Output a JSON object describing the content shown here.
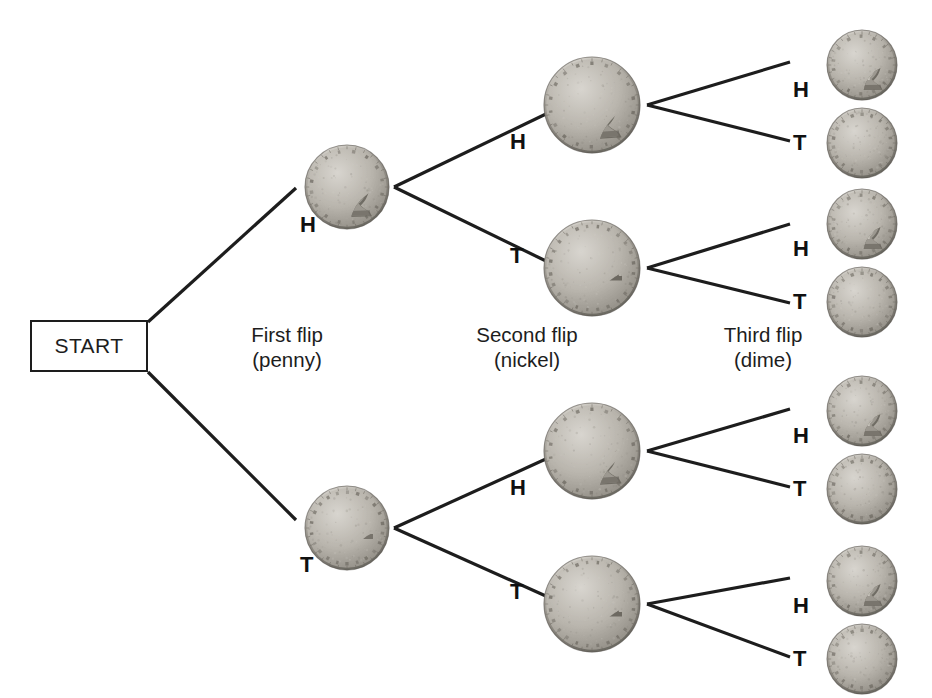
{
  "diagram": {
    "background_color": "#ffffff",
    "line_color": "#1d1d1d",
    "text_color": "#1d1d1d"
  },
  "start": {
    "label": "START",
    "x": 30,
    "y": 320,
    "w": 118,
    "h": 52
  },
  "stage_labels": [
    {
      "name": "first-flip",
      "line1": "First flip",
      "line2": "(penny)",
      "cx": 287,
      "y": 322
    },
    {
      "name": "second-flip",
      "line1": "Second flip",
      "line2": "(nickel)",
      "cx": 527,
      "y": 322
    },
    {
      "name": "third-flip",
      "line1": "Third flip",
      "line2": "(dime)",
      "cx": 763,
      "y": 322
    }
  ],
  "outcomes": {
    "heads": "H",
    "tails": "T"
  },
  "coins": {
    "penny": {
      "name": "penny",
      "diameter": 86,
      "heads_motif": "lincoln-profile",
      "tails_motif": "lincoln-memorial"
    },
    "nickel": {
      "name": "nickel",
      "diameter": 98,
      "heads_motif": "jefferson-profile",
      "tails_motif": "monticello"
    },
    "dime": {
      "name": "dime",
      "diameter": 72,
      "heads_motif": "roosevelt-profile",
      "tails_motif": "torch"
    }
  },
  "nodes": {
    "penny": [
      {
        "id": "p-H",
        "side": "heads",
        "label": "H",
        "cx": 347,
        "cy": 187,
        "label_x": 300,
        "label_y": 214
      },
      {
        "id": "p-T",
        "side": "tails",
        "label": "T",
        "cx": 347,
        "cy": 528,
        "label_x": 300,
        "label_y": 554
      }
    ],
    "nickel": [
      {
        "id": "n-HH",
        "side": "heads",
        "label": "H",
        "cx": 592,
        "cy": 105,
        "label_x": 510,
        "label_y": 131
      },
      {
        "id": "n-HT",
        "side": "tails",
        "label": "T",
        "cx": 592,
        "cy": 268,
        "label_x": 510,
        "label_y": 245
      },
      {
        "id": "n-TH",
        "side": "heads",
        "label": "H",
        "cx": 592,
        "cy": 451,
        "label_x": 510,
        "label_y": 477
      },
      {
        "id": "n-TT",
        "side": "tails",
        "label": "T",
        "cx": 592,
        "cy": 604,
        "label_x": 510,
        "label_y": 581
      }
    ],
    "dime": [
      {
        "id": "d-HHH",
        "side": "heads",
        "label": "H",
        "cx": 862,
        "cy": 65,
        "label_x": 793,
        "label_y": 79
      },
      {
        "id": "d-HHT",
        "side": "tails",
        "label": "T",
        "cx": 862,
        "cy": 143,
        "label_x": 793,
        "label_y": 132
      },
      {
        "id": "d-HTH",
        "side": "heads",
        "label": "H",
        "cx": 862,
        "cy": 224,
        "label_x": 793,
        "label_y": 238
      },
      {
        "id": "d-HTT",
        "side": "tails",
        "label": "T",
        "cx": 862,
        "cy": 302,
        "label_x": 793,
        "label_y": 291
      },
      {
        "id": "d-THH",
        "side": "heads",
        "label": "H",
        "cx": 862,
        "cy": 411,
        "label_x": 793,
        "label_y": 425
      },
      {
        "id": "d-THT",
        "side": "tails",
        "label": "T",
        "cx": 862,
        "cy": 489,
        "label_x": 793,
        "label_y": 478
      },
      {
        "id": "d-TTH",
        "side": "heads",
        "label": "H",
        "cx": 862,
        "cy": 581,
        "label_x": 793,
        "label_y": 595
      },
      {
        "id": "d-TTT",
        "side": "tails",
        "label": "T",
        "cx": 862,
        "cy": 659,
        "label_x": 793,
        "label_y": 648
      }
    ]
  },
  "edges": [
    {
      "name": "edge-start-to-penny-H",
      "x1": 148,
      "y1": 322,
      "x2": 296,
      "y2": 188
    },
    {
      "name": "edge-start-to-penny-T",
      "x1": 148,
      "y1": 372,
      "x2": 296,
      "y2": 520
    },
    {
      "name": "edge-penny-H-to-nickel-H",
      "x1": 394,
      "y1": 187,
      "x2": 548,
      "y2": 113
    },
    {
      "name": "edge-penny-H-to-nickel-T",
      "x1": 394,
      "y1": 187,
      "x2": 548,
      "y2": 262
    },
    {
      "name": "edge-penny-T-to-nickel-H",
      "x1": 394,
      "y1": 528,
      "x2": 548,
      "y2": 458
    },
    {
      "name": "edge-penny-T-to-nickel-T",
      "x1": 394,
      "y1": 528,
      "x2": 548,
      "y2": 597
    },
    {
      "name": "edge-nickel-HH-to-dime-H",
      "x1": 647,
      "y1": 105,
      "x2": 790,
      "y2": 62
    },
    {
      "name": "edge-nickel-HH-to-dime-T",
      "x1": 647,
      "y1": 105,
      "x2": 790,
      "y2": 141
    },
    {
      "name": "edge-nickel-HT-to-dime-H",
      "x1": 647,
      "y1": 268,
      "x2": 790,
      "y2": 224
    },
    {
      "name": "edge-nickel-HT-to-dime-T",
      "x1": 647,
      "y1": 268,
      "x2": 790,
      "y2": 303
    },
    {
      "name": "edge-nickel-TH-to-dime-H",
      "x1": 647,
      "y1": 451,
      "x2": 790,
      "y2": 409
    },
    {
      "name": "edge-nickel-TH-to-dime-T",
      "x1": 647,
      "y1": 451,
      "x2": 790,
      "y2": 487
    },
    {
      "name": "edge-nickel-TT-to-dime-H",
      "x1": 647,
      "y1": 604,
      "x2": 790,
      "y2": 578
    },
    {
      "name": "edge-nickel-TT-to-dime-T",
      "x1": 647,
      "y1": 604,
      "x2": 790,
      "y2": 657
    }
  ]
}
